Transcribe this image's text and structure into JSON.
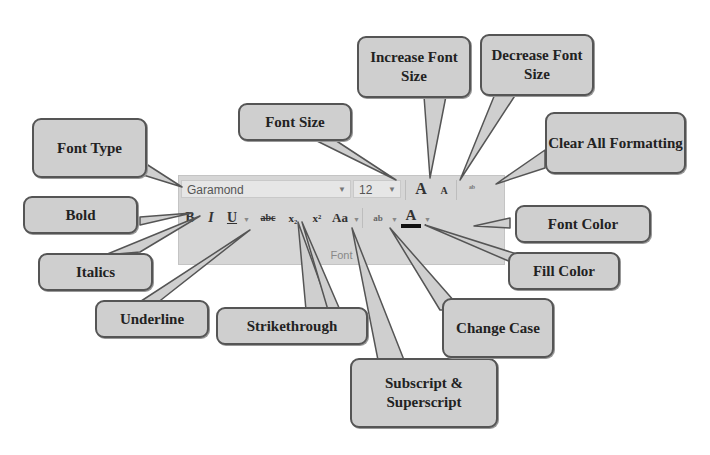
{
  "ribbon": {
    "group_label": "Font",
    "font_name": "Garamond",
    "font_size": "12",
    "buttons": {
      "increase_font": "A",
      "decrease_font": "A",
      "clear_formatting": "ᵃᵇ",
      "bold": "B",
      "italic": "I",
      "underline": "U",
      "strikethrough": "abc",
      "subscript": "x₂",
      "superscript": "x²",
      "change_case": "Aa",
      "fill_color": "ab",
      "font_color": "A"
    }
  },
  "callouts": {
    "font_type": "Font Type",
    "font_size": "Font Size",
    "increase_font_size": "Increase Font Size",
    "decrease_font_size": "Decrease Font Size",
    "clear_all_formatting": "Clear All Formatting",
    "bold": "Bold",
    "italics": "Italics",
    "underline": "Underline",
    "strikethrough": "Strikethrough",
    "subscript_superscript": "Subscript & Superscript",
    "change_case": "Change Case",
    "fill_color": "Fill Color",
    "font_color": "Font Color"
  },
  "colors": {
    "callout_fill": "#cfcfcf",
    "callout_border": "#555555",
    "ribbon_bg": "#d6d6d6"
  }
}
